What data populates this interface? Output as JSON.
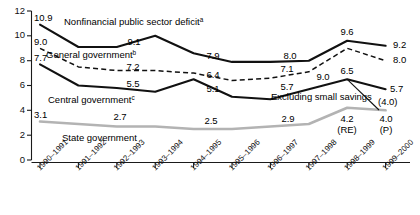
{
  "chart_data": {
    "type": "line",
    "title": "",
    "xlabel": "",
    "ylabel": "",
    "ylim": [
      0,
      12
    ],
    "yticks": [
      "0",
      "2",
      "4",
      "6",
      "8",
      "10",
      "12"
    ],
    "grid": false,
    "legend": "inline-annotations",
    "categories": [
      "1990–1991",
      "1991–1992",
      "1992–1993",
      "1993–1994",
      "1994–1995",
      "1995–1996",
      "1996–1997",
      "1997–1998",
      "1998–1999",
      "1999–2000"
    ],
    "series": [
      {
        "name": "Nonfinancial public sector deficit",
        "note_marker": "a",
        "style": "solid-black",
        "values": [
          10.9,
          9.1,
          9.1,
          10.0,
          8.6,
          7.9,
          7.9,
          8.0,
          9.6,
          9.2
        ],
        "labels": [
          {
            "category": "1990–1991",
            "value": 10.9,
            "text": "10.9"
          },
          {
            "category": "1992–1993",
            "value": 9.1,
            "text": "9.1"
          },
          {
            "category": "1995–1996",
            "value": 7.9,
            "text": "7.9"
          },
          {
            "category": "1997–1998",
            "value": 8.0,
            "text": "8.0"
          },
          {
            "category": "1998–1999",
            "value": 9.6,
            "text": "9.6"
          },
          {
            "category": "1999–2000",
            "value": 9.2,
            "text": "9.2"
          }
        ]
      },
      {
        "name": "General government",
        "note_marker": "b",
        "style": "dashed-black",
        "values": [
          9.0,
          7.5,
          7.2,
          7.2,
          7.0,
          6.4,
          6.6,
          7.1,
          9.0,
          8.0
        ],
        "labels": [
          {
            "category": "1990–1991",
            "value": 9.0,
            "text": "9.0"
          },
          {
            "category": "1993–1994",
            "value": 7.2,
            "text": "7.2"
          },
          {
            "category": "1995–1996",
            "value": 6.4,
            "text": "6.4"
          },
          {
            "category": "1997–1998",
            "value": 7.1,
            "text": "7.1"
          },
          {
            "category": "1998–1999",
            "value": 9.0,
            "text": "9.0"
          },
          {
            "category": "1999–2000",
            "value": 8.0,
            "text": "8.0"
          }
        ]
      },
      {
        "name": "Central government",
        "note_marker": "c",
        "style": "solid-black",
        "values": [
          7.7,
          6.0,
          5.8,
          5.5,
          6.5,
          5.1,
          4.9,
          5.7,
          6.5,
          5.7
        ],
        "labels": [
          {
            "category": "1993–1994",
            "value": 5.5,
            "text": "5.5"
          },
          {
            "category": "1990–1991",
            "value": 7.7,
            "text": "7.7"
          },
          {
            "category": "1995–1996",
            "value": 5.1,
            "text": "5.1"
          },
          {
            "category": "1997–1998",
            "value": 5.7,
            "text": "5.7"
          },
          {
            "category": "1998–1999",
            "value": 6.5,
            "text": "6.5"
          },
          {
            "category": "1999–2000",
            "value": 5.7,
            "text": "5.7"
          }
        ]
      },
      {
        "name": "State government",
        "note_marker": "",
        "style": "solid-grey",
        "values": [
          3.1,
          2.9,
          2.7,
          2.7,
          2.5,
          2.5,
          2.7,
          2.9,
          4.2,
          4.0
        ],
        "labels": [
          {
            "category": "1990–1991",
            "value": 3.1,
            "text": "3.1"
          },
          {
            "category": "1992–1993",
            "value": 2.7,
            "text": "2.7"
          },
          {
            "category": "1994–1995",
            "value": 2.5,
            "text": "2.5"
          },
          {
            "category": "1997–1998",
            "value": 2.9,
            "text": "2.9"
          },
          {
            "category": "1998–1999",
            "value": 4.2,
            "text": "4.2"
          },
          {
            "category": "1999–2000",
            "value": 4.0,
            "text": "4.0"
          }
        ]
      }
    ],
    "annotations": [
      {
        "name": "series-label-nonfinancial",
        "text": "Nonfinancial public sector deficit",
        "sup": "a"
      },
      {
        "name": "series-label-general",
        "text": "General government",
        "sup": "b"
      },
      {
        "name": "series-label-central",
        "text": "Central government",
        "sup": "c"
      },
      {
        "name": "series-label-state",
        "text": "State government",
        "sup": ""
      },
      {
        "name": "excluding-small-savings-note",
        "text": "Excluding small savings",
        "sup": ""
      },
      {
        "name": "excluding-small-savings-value",
        "text": "(4.0)",
        "sup": ""
      },
      {
        "name": "revised-estimate-marker",
        "text": "(RE)",
        "sup": ""
      },
      {
        "name": "provisional-marker",
        "text": "(P)",
        "sup": ""
      }
    ]
  },
  "axis": {
    "y_tick_labels": [
      "12",
      "10",
      "8",
      "6",
      "4",
      "2",
      "0"
    ],
    "x_tick_labels": [
      "1990–1991",
      "1991–1992",
      "1992–1993",
      "1993–1994",
      "1994–1995",
      "1995–1996",
      "1996–1997",
      "1997–1998",
      "1998–1999",
      "1999–2000"
    ]
  },
  "datalabels": {
    "nf_1990": "10.9",
    "nf_1992": "9.1",
    "nf_1995": "7.9",
    "nf_1997": "8.0",
    "nf_1998": "9.6",
    "nf_1999": "9.2",
    "gg_1990": "9.0",
    "gg_1993": "7.2",
    "gg_1995": "6.4",
    "gg_1997": "7.1",
    "gg_1998": "9.0",
    "gg_1999": "8.0",
    "cg_1990": "7.7",
    "cg_1993": "5.5",
    "cg_1995": "5.1",
    "cg_1997": "5.7",
    "cg_1998": "6.5",
    "cg_1999": "5.7",
    "sg_1990": "3.1",
    "sg_1992": "2.7",
    "sg_1994": "2.5",
    "sg_1997": "2.9",
    "sg_1998": "4.2",
    "sg_1999": "4.0",
    "ess_value": "(4.0)",
    "re_marker": "(RE)",
    "p_marker": "(P)"
  },
  "labels": {
    "nonfinancial": "Nonfinancial public sector deficit",
    "nonfinancial_sup": "a",
    "general": "General government",
    "general_sup": "b",
    "central": "Central government",
    "central_sup": "c",
    "state": "State government",
    "excluding": "Excluding small savings"
  },
  "colors": {
    "line_black": "#111111",
    "line_grey": "#b3b3b3",
    "axis": "#1a1a1a",
    "background": "#ffffff"
  }
}
